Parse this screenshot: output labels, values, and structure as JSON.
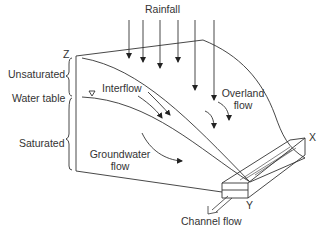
{
  "diagram": {
    "type": "hillslope runoff processes",
    "labels": {
      "rainfall": "Rainfall",
      "axis_z": "Z",
      "axis_x": "X",
      "axis_y": "Y",
      "unsaturated": "Unsaturated",
      "water_table": "Water table",
      "saturated": "Saturated",
      "interflow": "Interflow",
      "overland_flow_line1": "Overland",
      "overland_flow_line2": "flow",
      "groundwater_flow_line1": "Groundwater",
      "groundwater_flow_line2": "flow",
      "channel_flow": "Channel flow"
    },
    "colors": {
      "line": "#333333",
      "text": "#333333",
      "background": "#ffffff"
    }
  }
}
